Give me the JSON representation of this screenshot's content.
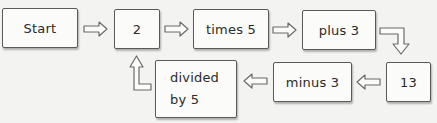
{
  "diagram": {
    "type": "flowchart",
    "colors": {
      "background": "#f3f3f1",
      "box_fill": "#fbfbfa",
      "box_border": "#5a5a5a",
      "text": "#2a2a2a",
      "arrow_stroke": "#6a6a6a"
    },
    "nodes": [
      {
        "id": "start",
        "label": "Start"
      },
      {
        "id": "n2",
        "label": "2"
      },
      {
        "id": "times5",
        "label": "times 5"
      },
      {
        "id": "plus3",
        "label": "plus 3"
      },
      {
        "id": "n13",
        "label": "13"
      },
      {
        "id": "minus3",
        "label": "minus 3"
      },
      {
        "id": "div5",
        "label_line1": "divided",
        "label_line2": "by 5"
      }
    ],
    "edges": [
      {
        "from": "start",
        "to": "n2",
        "direction": "right"
      },
      {
        "from": "n2",
        "to": "times5",
        "direction": "right"
      },
      {
        "from": "times5",
        "to": "plus3",
        "direction": "right"
      },
      {
        "from": "plus3",
        "to": "n13",
        "direction": "right-then-down"
      },
      {
        "from": "n13",
        "to": "minus3",
        "direction": "left"
      },
      {
        "from": "minus3",
        "to": "div5",
        "direction": "left"
      },
      {
        "from": "div5",
        "to": "n2",
        "direction": "left-then-up"
      }
    ]
  }
}
